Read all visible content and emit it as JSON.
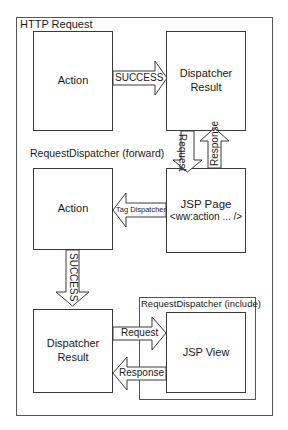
{
  "diagram": {
    "outer_label": "HTTP Request",
    "forward_label": "RequestDispatcher  (forward)",
    "include_label": "RequestDispatcher  (include)",
    "nodes": {
      "action_top": "Action",
      "dispatcher_result_top": [
        "Dispatcher",
        "Result"
      ],
      "action_mid": "Action",
      "jsp_page": [
        "JSP Page",
        "<ww:action ... />"
      ],
      "dispatcher_result_bottom": [
        "Dispatcher",
        "Result"
      ],
      "jsp_view": "JSP View"
    },
    "arrows": {
      "success_top": "SUCCESS",
      "request_down": "Request",
      "response_up": "Response",
      "tag_dispatcher": "Tag Dispatcher",
      "success_down": "SUCCESS",
      "request_right": "Request",
      "response_left": "Response"
    },
    "colors": {
      "stroke": "#3a3a3a",
      "fill": "#ffffff",
      "text": "#1a1a1a"
    }
  }
}
